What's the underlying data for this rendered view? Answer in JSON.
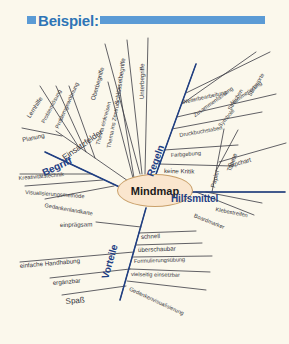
{
  "header": {
    "bullet_icon": "square-bullet-icon",
    "title": "Beispiel:",
    "accent_color": "#5b9bd5",
    "title_color": "#2e75b6"
  },
  "page": {
    "background_color": "#fbf8ec"
  },
  "mindmap": {
    "center": {
      "label": "Mindmap",
      "fill_color": "#fae6ce",
      "border_color": "#c9a06a"
    },
    "main_branches": [
      {
        "label": "Einsatzfelder",
        "color": "#26262b"
      },
      {
        "label": "Begriff",
        "color": "#1f3f84"
      },
      {
        "label": "Regeln",
        "color": "#1f3f84"
      },
      {
        "label": "Hilfsmittel",
        "color": "#1f3f84"
      },
      {
        "label": "Vorteile",
        "color": "#1f3f84"
      }
    ],
    "sub_branches": [
      "Lernhilfe",
      "Problemlösung",
      "Problemgewöhnung",
      "Planung",
      "Kreativitätstechnik",
      "Visualisierungsmethode",
      "Gedankenlandkarte",
      "Thema einkreisen",
      "Thema ins Zentrum",
      "Oberbegriffe",
      "Schlüsselbegriffe",
      "Unterbegriffe",
      "Weiterbearbeitung",
      "Streichen",
      "Zusammenfassung",
      "Nummerierung",
      "Symbole",
      "Druckbuchstaben",
      "Stichworte",
      "Farbgebung",
      "keine Kritik",
      "Papier",
      "Tapete",
      "Flipchart",
      "Klebestreifen",
      "Boardmarker",
      "einprägsam",
      "einfache Handhabung",
      "ergänzbar",
      "Spaß",
      "schnell",
      "überschaubar",
      "Formulierungsübung",
      "vielseitig einsetzbar",
      "Gedankenvisualisierung"
    ]
  },
  "labels": {
    "lernhilfe": "Lernhilfe",
    "problemloesung": "Problemlösung",
    "problemgewoehnung": "Problemgewöhnung",
    "planung": "Planung",
    "einsatzfelder": "Einsatzfelder",
    "begriff": "Begriff",
    "kreativitaetstechnik": "Kreativitätstechnik",
    "visualisierungsmethode": "Visualisierungsmethode",
    "gedankenlandkarte": "Gedankenlandkarte",
    "thema_einkreisen": "Thema einkreisen",
    "thema_ins_zentrum": "Thema ins Zentrum",
    "oberbegriffe": "Oberbegriffe",
    "schluesselbegriffe": "Schlüsselbegriffe",
    "unterbegriffe": "Unterbegriffe",
    "regeln": "Regeln",
    "weiterbearbeitung": "Weiterbearbeitung",
    "streichen": "Streichen",
    "zusammenfassung": "Zusammenfassung",
    "nummerierung": "Nummerierung",
    "symbole": "Symbole",
    "druckbuchstaben": "Druckbuchstaben",
    "stichworte": "Stichworte",
    "farbgebung": "Farbgebung",
    "keine_kritik": "keine Kritik",
    "hilfsmittel": "Hilfsmittel",
    "papier": "Papier",
    "tapete": "Tapete",
    "flipchart": "Flipchart",
    "klebestreifen": "Klebestreifen",
    "boardmarker": "Boardmarker",
    "einpraegsam": "einprägsam",
    "einfache_handhabung": "einfache Handhabung",
    "ergaenzbar": "ergänzbar",
    "spass": "Spaß",
    "vorteile": "Vorteile",
    "schnell": "schnell",
    "ueberschaubar": "überschaubar",
    "formulierungsuebung": "Formulierungsübung",
    "vielseitig_einsetzbar": "vielseitig einsetzbar",
    "gedankenvisualisierung": "Gedankenvisualisierung"
  }
}
